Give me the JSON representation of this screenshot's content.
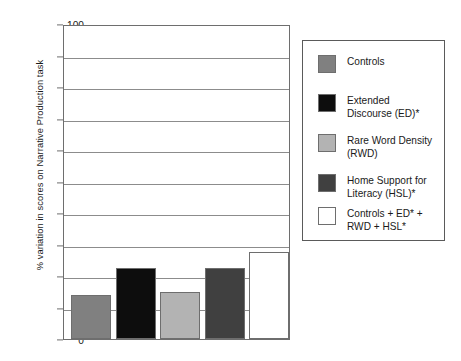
{
  "chart_data": {
    "type": "bar",
    "title": "",
    "xlabel": "",
    "ylabel": "% variation in scores on Narrative Production task",
    "ylim": [
      0,
      100
    ],
    "yticks": [
      0,
      10,
      20,
      30,
      40,
      50,
      60,
      70,
      80,
      90,
      100
    ],
    "grid": true,
    "legend_position": "right",
    "categories": [
      "Controls",
      "Extended Discourse (ED)*",
      "Rare Word Density (RWD)",
      "Home Support for Literacy (HSL)*",
      "Controls + ED* + RWD + HSL*"
    ],
    "values": [
      14,
      22.5,
      14.8,
      22.5,
      27.5
    ],
    "colors": [
      "#808080",
      "#0d0d0d",
      "#b3b3b3",
      "#404040",
      "#ffffff"
    ]
  },
  "axis": {
    "ylabel": "% variation in scores on Narrative Production task",
    "ticks": [
      {
        "value": 100,
        "label": "100"
      },
      {
        "value": 90,
        "label": "90"
      },
      {
        "value": 80,
        "label": "80"
      },
      {
        "value": 70,
        "label": "70"
      },
      {
        "value": 60,
        "label": "60"
      },
      {
        "value": 50,
        "label": "50"
      },
      {
        "value": 40,
        "label": "40"
      },
      {
        "value": 30,
        "label": "30"
      },
      {
        "value": 20,
        "label": "20"
      },
      {
        "value": 10,
        "label": "10"
      },
      {
        "value": 0,
        "label": "0"
      }
    ]
  },
  "legend": {
    "items": [
      {
        "label": "Controls",
        "color": "#808080"
      },
      {
        "label": "Extended\nDiscourse (ED)*",
        "color": "#0d0d0d"
      },
      {
        "label": "Rare Word Density\n(RWD)",
        "color": "#b3b3b3"
      },
      {
        "label": "Home Support for\nLiteracy (HSL)*",
        "color": "#404040"
      },
      {
        "label": "Controls + ED* +\nRWD + HSL*",
        "color": "#ffffff"
      }
    ]
  }
}
